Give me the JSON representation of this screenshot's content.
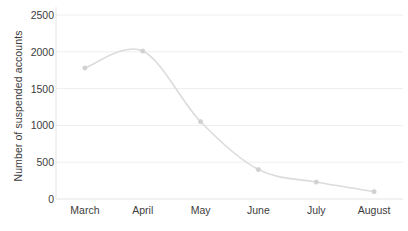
{
  "chart_data": {
    "type": "line",
    "title": "",
    "subtitle": "",
    "xlabel": "",
    "ylabel": "Number of suspended accounts",
    "categories": [
      "March",
      "April",
      "May",
      "June",
      "July",
      "August"
    ],
    "values": [
      1780,
      2010,
      1050,
      400,
      230,
      100
    ],
    "series": [
      {
        "name": "Number of suspended accounts",
        "values": [
          1780,
          2010,
          1050,
          400,
          230,
          100
        ]
      }
    ],
    "ylim": [
      0,
      2500
    ],
    "yticks": [
      0,
      500,
      1000,
      1500,
      2000,
      2500
    ],
    "ytick_labels": [
      "0",
      "500",
      "1000",
      "1500",
      "2000",
      "2500"
    ],
    "grid": true,
    "grid_axis": "y",
    "legend": false,
    "legend_position": "none",
    "markers": true,
    "line_style": "smooth",
    "colors": {
      "line": "#dcdcdc",
      "marker": "#d0d0d0",
      "grid": "#eeeeee",
      "axis": "#e4e4e4",
      "text": "#3c3c3c",
      "background": "#ffffff"
    }
  },
  "axis": {
    "y_title": "Number of suspended accounts"
  }
}
